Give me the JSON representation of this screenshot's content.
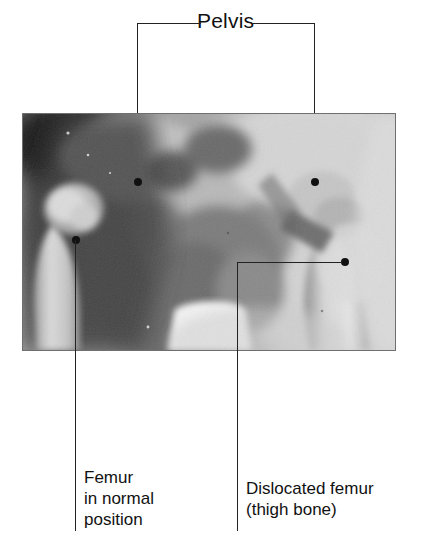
{
  "figure": {
    "type": "annotated-radiograph",
    "background_color": "#ffffff",
    "line_color": "#222222"
  },
  "labels": {
    "pelvis": "Pelvis",
    "femur_normal": "Femur\nin normal\nposition",
    "femur_dislocated": "Dislocated femur\n(thigh bone)"
  },
  "annotations": [
    {
      "name": "pelvis-left",
      "label": "Pelvis",
      "marker": "dot",
      "marker_x": 137,
      "marker_y": 182
    },
    {
      "name": "pelvis-right",
      "label": "Pelvis",
      "marker": "dot",
      "marker_x": 314,
      "marker_y": 182
    },
    {
      "name": "femur-normal",
      "label": "Femur in normal position",
      "marker": "dot",
      "marker_x": 75,
      "marker_y": 240
    },
    {
      "name": "femur-dislocated",
      "label": "Dislocated femur (thigh bone)",
      "marker": "dot",
      "marker_x": 344,
      "marker_y": 262
    }
  ],
  "xray": {
    "alt": "Black and white radiograph of a pelvis with both hip joints visible",
    "left": 22,
    "top": 113,
    "width": 374,
    "height": 238,
    "tones": {
      "darkest": "#2b2b2b",
      "dark": "#5a5a5a",
      "mid": "#9a9a9a",
      "light": "#c9c9c9",
      "brightest": "#f2f2f2"
    }
  }
}
